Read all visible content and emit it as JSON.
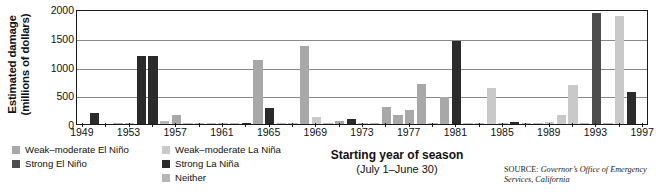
{
  "axes": {
    "y_title_line1": "Estimated damage",
    "y_title_line2": "(millions of dollars)",
    "x_title_line1": "Starting year of season",
    "x_title_line2": "(July 1–June 30)"
  },
  "source": {
    "label": "SOURCE:",
    "body": "Governor’s Office of Emergency Services, California"
  },
  "legend": {
    "items": [
      {
        "label": "Weak–moderate El Niño",
        "color": "#a8a8a8",
        "key": "weak-moderate-el-nino"
      },
      {
        "label": "Strong El Niño",
        "color": "#4d4d4d",
        "key": "strong-el-nino"
      },
      {
        "label": "Weak–moderate La Niña",
        "color": "#c9c9c9",
        "key": "weak-moderate-la-nina"
      },
      {
        "label": "Strong La Niña",
        "color": "#2b2b2b",
        "key": "strong-la-nina"
      },
      {
        "label": "Neither",
        "color": "#b5b5b5",
        "key": "neither"
      }
    ]
  },
  "chart_data": {
    "type": "bar",
    "title": "",
    "xlabel": "Starting year of season (July 1–June 30)",
    "ylabel": "Estimated damage (millions of dollars)",
    "ylim": [
      0,
      2000
    ],
    "yticks": [
      0,
      500,
      1000,
      1500,
      2000
    ],
    "ytick_labels": [
      "0",
      "500",
      "1000",
      "1500",
      "2000"
    ],
    "grid": true,
    "legend_position": "below-left",
    "xlim": [
      1948.5,
      1997.5
    ],
    "xtick_labels": [
      "1949",
      "1953",
      "1957",
      "1961",
      "1965",
      "1969",
      "1973",
      "1977",
      "1981",
      "1985",
      "1989",
      "1993",
      "1997"
    ],
    "xticks": [
      1949,
      1953,
      1957,
      1961,
      1965,
      1969,
      1973,
      1977,
      1981,
      1985,
      1989,
      1993,
      1997
    ],
    "category_colors": {
      "weak-moderate-el-nino": "#a8a8a8",
      "strong-el-nino": "#4d4d4d",
      "weak-moderate-la-nina": "#c9c9c9",
      "strong-la-nina": "#2b2b2b",
      "neither": "#b5b5b5"
    },
    "bars": [
      {
        "year": 1949,
        "value": 0,
        "category": "neither"
      },
      {
        "year": 1950,
        "value": 200,
        "category": "strong-la-nina"
      },
      {
        "year": 1951,
        "value": 0,
        "category": "neither"
      },
      {
        "year": 1952,
        "value": 10,
        "category": "weak-moderate-el-nino"
      },
      {
        "year": 1953,
        "value": 5,
        "category": "neither"
      },
      {
        "year": 1954,
        "value": 1190,
        "category": "strong-la-nina"
      },
      {
        "year": 1955,
        "value": 1190,
        "category": "strong-la-nina"
      },
      {
        "year": 1956,
        "value": 60,
        "category": "neither"
      },
      {
        "year": 1957,
        "value": 150,
        "category": "weak-moderate-el-nino"
      },
      {
        "year": 1958,
        "value": 8,
        "category": "neither"
      },
      {
        "year": 1959,
        "value": 5,
        "category": "neither"
      },
      {
        "year": 1960,
        "value": 5,
        "category": "neither"
      },
      {
        "year": 1961,
        "value": 5,
        "category": "neither"
      },
      {
        "year": 1962,
        "value": 8,
        "category": "neither"
      },
      {
        "year": 1963,
        "value": 15,
        "category": "strong-la-nina"
      },
      {
        "year": 1964,
        "value": 1120,
        "category": "weak-moderate-el-nino"
      },
      {
        "year": 1965,
        "value": 280,
        "category": "strong-la-nina"
      },
      {
        "year": 1966,
        "value": 10,
        "category": "neither"
      },
      {
        "year": 1967,
        "value": 8,
        "category": "neither"
      },
      {
        "year": 1968,
        "value": 1350,
        "category": "weak-moderate-el-nino"
      },
      {
        "year": 1969,
        "value": 120,
        "category": "weak-moderate-la-nina"
      },
      {
        "year": 1970,
        "value": 10,
        "category": "neither"
      },
      {
        "year": 1971,
        "value": 60,
        "category": "weak-moderate-el-nino"
      },
      {
        "year": 1972,
        "value": 90,
        "category": "strong-la-nina"
      },
      {
        "year": 1973,
        "value": 20,
        "category": "neither"
      },
      {
        "year": 1974,
        "value": 15,
        "category": "neither"
      },
      {
        "year": 1975,
        "value": 300,
        "category": "weak-moderate-el-nino"
      },
      {
        "year": 1976,
        "value": 160,
        "category": "weak-moderate-el-nino"
      },
      {
        "year": 1977,
        "value": 250,
        "category": "weak-moderate-el-nino"
      },
      {
        "year": 1978,
        "value": 700,
        "category": "weak-moderate-el-nino"
      },
      {
        "year": 1979,
        "value": 20,
        "category": "neither"
      },
      {
        "year": 1980,
        "value": 470,
        "category": "weak-moderate-el-nino"
      },
      {
        "year": 1981,
        "value": 1440,
        "category": "strong-la-nina"
      },
      {
        "year": 1982,
        "value": 20,
        "category": "neither"
      },
      {
        "year": 1983,
        "value": 8,
        "category": "neither"
      },
      {
        "year": 1984,
        "value": 620,
        "category": "weak-moderate-la-nina"
      },
      {
        "year": 1985,
        "value": 10,
        "category": "neither"
      },
      {
        "year": 1986,
        "value": 40,
        "category": "strong-la-nina"
      },
      {
        "year": 1987,
        "value": 10,
        "category": "neither"
      },
      {
        "year": 1988,
        "value": 8,
        "category": "neither"
      },
      {
        "year": 1989,
        "value": 40,
        "category": "weak-moderate-la-nina"
      },
      {
        "year": 1990,
        "value": 150,
        "category": "weak-moderate-la-nina"
      },
      {
        "year": 1991,
        "value": 680,
        "category": "weak-moderate-la-nina"
      },
      {
        "year": 1992,
        "value": 20,
        "category": "neither"
      },
      {
        "year": 1993,
        "value": 1930,
        "category": "strong-el-nino"
      },
      {
        "year": 1994,
        "value": 15,
        "category": "neither"
      },
      {
        "year": 1995,
        "value": 1870,
        "category": "weak-moderate-la-nina"
      },
      {
        "year": 1996,
        "value": 550,
        "category": "strong-la-nina"
      }
    ]
  }
}
